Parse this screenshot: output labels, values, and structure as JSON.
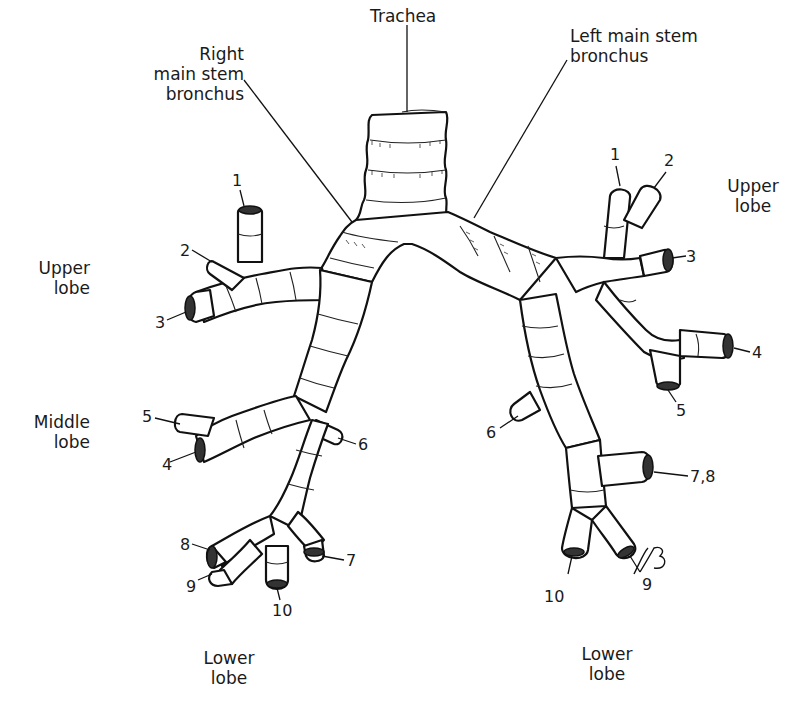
{
  "structures": {
    "trachea": "Trachea",
    "right_main_stem": "Right\nmain stem\nbronchus",
    "left_main_stem": "Left main stem\nbronchus"
  },
  "right_lung": {
    "upper_lobe": {
      "label": "Upper\nlobe",
      "segments": [
        "1",
        "2",
        "3"
      ]
    },
    "middle_lobe": {
      "label": "Middle\nlobe",
      "segments": [
        "4",
        "5"
      ]
    },
    "lower_lobe": {
      "label": "Lower\nlobe",
      "segments": [
        "6",
        "7",
        "8",
        "9",
        "10"
      ]
    }
  },
  "left_lung": {
    "upper_lobe": {
      "label": "Upper\nlobe",
      "segments": [
        "1",
        "2",
        "3",
        "4",
        "5"
      ]
    },
    "lower_lobe": {
      "label": "Lower\nlobe",
      "segments": [
        "6",
        "7,8",
        "9",
        "10"
      ]
    }
  },
  "signature": "RB",
  "colors": {
    "line": "#111111",
    "background": "#ffffff"
  }
}
